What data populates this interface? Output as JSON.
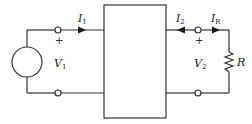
{
  "diagram": {
    "type": "two-port-network-circuit",
    "colors": {
      "line": "#333333",
      "background": "#ffffff"
    },
    "source": {
      "symbol": "V",
      "subscript": "1",
      "polarity_mark": "+"
    },
    "current_in": {
      "symbol": "I",
      "subscript": "1"
    },
    "port2_current": {
      "symbol": "I",
      "subscript": "2"
    },
    "load_current": {
      "symbol": "I",
      "subscript": "R"
    },
    "port2_voltage": {
      "symbol": "V",
      "subscript": "2",
      "polarity_mark": "+"
    },
    "load": {
      "symbol": "R"
    }
  }
}
